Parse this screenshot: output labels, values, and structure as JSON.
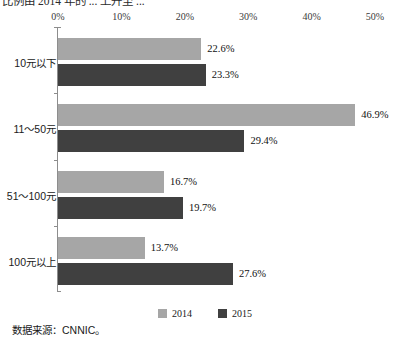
{
  "caption": {
    "text": "比例由 2014 年的 ... 上升至 ..."
  },
  "source_note": {
    "text": "数据来源：CNNIC。"
  },
  "legend": {
    "position": "bottom-center",
    "items": [
      {
        "label": "2014",
        "color": "#a6a6a6"
      },
      {
        "label": "2015",
        "color": "#404040"
      }
    ]
  },
  "colors": {
    "series_2014": "#a6a6a6",
    "series_2015": "#404040",
    "axis": "#8d8d8d",
    "text": "#1a1a1a",
    "background": "#ffffff"
  },
  "chart_data": {
    "type": "bar",
    "orientation": "horizontal",
    "title": "",
    "subtitle": "",
    "xlabel": "",
    "ylabel": "",
    "xlim": [
      0,
      50
    ],
    "xticks": [
      "0%",
      "10%",
      "20%",
      "30%",
      "40%",
      "50%"
    ],
    "xtick_values": [
      0,
      10,
      20,
      30,
      40,
      50
    ],
    "grid": false,
    "legend_position": "bottom",
    "categories": [
      "10元以下",
      "11～50元",
      "51～100元",
      "100元以上"
    ],
    "series": [
      {
        "name": "2014",
        "color": "#a6a6a6",
        "values": [
          22.6,
          46.9,
          16.7,
          13.7
        ],
        "labels": [
          "22.6%",
          "46.9%",
          "16.7%",
          "13.7%"
        ]
      },
      {
        "name": "2015",
        "color": "#404040",
        "values": [
          23.3,
          29.4,
          19.7,
          27.6
        ],
        "labels": [
          "23.3%",
          "29.4%",
          "19.7%",
          "27.6%"
        ]
      }
    ]
  }
}
